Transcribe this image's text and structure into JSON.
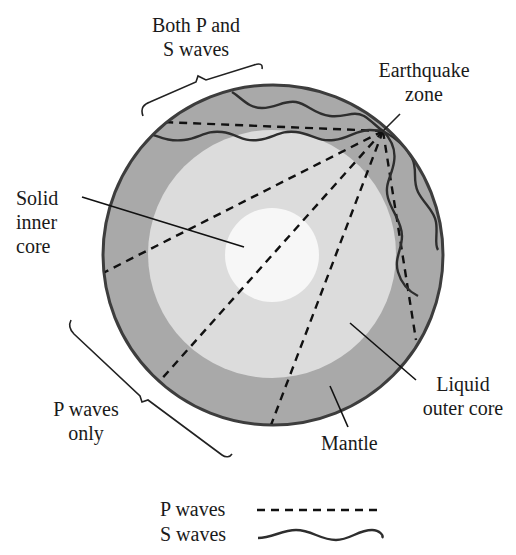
{
  "labels": {
    "both_waves_line1": "Both P and",
    "both_waves_line2": "S waves",
    "earthquake_line1": "Earthquake",
    "earthquake_line2": "zone",
    "solid_line1": "Solid",
    "solid_line2": "inner",
    "solid_line3": "core",
    "p_only_line1": "P waves",
    "p_only_line2": "only",
    "liquid_line1": "Liquid",
    "liquid_line2": "outer core",
    "mantle": "Mantle"
  },
  "legend": {
    "items": [
      {
        "label": "P waves",
        "style": "dashed"
      },
      {
        "label": "S waves",
        "style": "wavy"
      }
    ]
  },
  "layers": [
    {
      "name": "Mantle",
      "color": "#a9a9a9"
    },
    {
      "name": "Liquid outer core",
      "color": "#dcdcdc"
    },
    {
      "name": "Solid inner core",
      "color": "#f7f7f7"
    }
  ],
  "colors": {
    "outline": "#3d3d3d",
    "wave": "#2e2e2e",
    "text": "#1a1a1a"
  }
}
